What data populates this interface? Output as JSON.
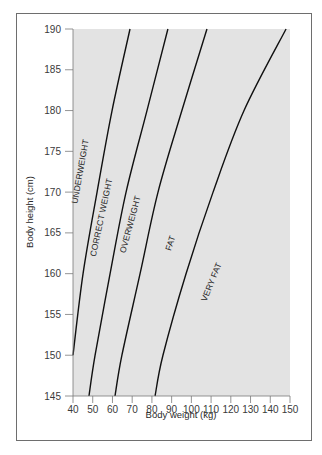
{
  "chart_data": {
    "type": "line",
    "title": "",
    "xlabel": "Body weight (kg)",
    "ylabel": "Body height (cm)",
    "xlim": [
      40,
      150
    ],
    "ylim": [
      145,
      190
    ],
    "x_ticks": [
      40,
      50,
      60,
      70,
      80,
      90,
      100,
      110,
      120,
      130,
      140,
      150
    ],
    "y_ticks": [
      145,
      150,
      155,
      160,
      165,
      170,
      175,
      180,
      185,
      190
    ],
    "grid": false,
    "legend": "none",
    "plot_background": "#e3e3e3",
    "series": [
      {
        "name": "Underweight / Correct weight boundary",
        "points": [
          [
            40,
            150
          ],
          [
            45.1,
            160
          ],
          [
            52.2,
            170
          ],
          [
            59.8,
            180
          ],
          [
            68.9,
            190
          ]
        ]
      },
      {
        "name": "Correct weight / Overweight boundary",
        "points": [
          [
            48.1,
            145
          ],
          [
            51.2,
            150
          ],
          [
            58.8,
            160
          ],
          [
            66.9,
            170
          ],
          [
            77.5,
            180
          ],
          [
            88.1,
            190
          ]
        ]
      },
      {
        "name": "Overweight / Fat boundary",
        "points": [
          [
            61.3,
            145
          ],
          [
            64.8,
            150
          ],
          [
            74.0,
            160
          ],
          [
            83.1,
            170
          ],
          [
            95.2,
            180
          ],
          [
            107.9,
            190
          ]
        ]
      },
      {
        "name": "Fat / Very fat boundary",
        "points": [
          [
            81.6,
            145
          ],
          [
            85.6,
            150
          ],
          [
            97.3,
            160
          ],
          [
            111.0,
            170
          ],
          [
            126.7,
            180
          ],
          [
            148.0,
            190
          ]
        ]
      }
    ],
    "annotations": [
      {
        "text": "UNDERWEIGHT",
        "x": 43.5,
        "y": 172,
        "rotation": -80
      },
      {
        "text": "CORRECT WEIGHT",
        "x": 52.5,
        "y": 165.5,
        "rotation": -78
      },
      {
        "text": "OVERWEIGHT",
        "x": 64.5,
        "y": 165,
        "rotation": -75
      },
      {
        "text": "FAT",
        "x": 83,
        "y": 163,
        "rotation": -72
      },
      {
        "text": "VERY FAT",
        "x": 104,
        "y": 158,
        "rotation": -68
      }
    ]
  },
  "axes": {
    "x_title": "Body weight (kg)",
    "y_title": "Body height (cm)"
  },
  "labels": {
    "underweight": "UNDERWEIGHT",
    "correct_weight": "CORRECT WEIGHT",
    "overweight": "OVERWEIGHT",
    "fat": "FAT",
    "very_fat": "VERY FAT"
  },
  "colors": {
    "plot_fill": "#e3e3e3",
    "curve": "#111111",
    "axis": "#7a7a7a",
    "frame": "#6e6e6e"
  }
}
